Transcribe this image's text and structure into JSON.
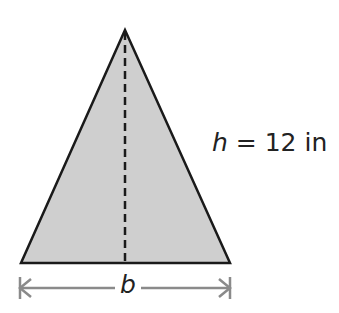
{
  "figure": {
    "shape": "triangle",
    "fill_color": "#cfcfcf",
    "stroke_color": "#1a1a1a",
    "arrow_color": "#8a8a8a",
    "height_label": {
      "variable": "h",
      "equals": "=",
      "value": "12 in"
    },
    "base_label": {
      "variable": "b"
    }
  }
}
